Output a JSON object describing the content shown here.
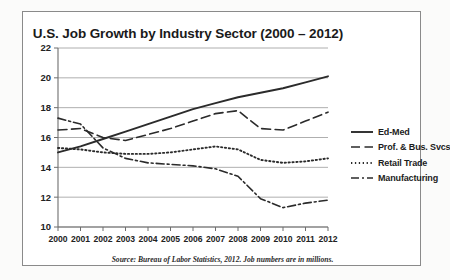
{
  "chart_data": {
    "type": "line",
    "title": "U.S. Job Growth by Industry Sector (2000 – 2012)",
    "xlabel": "",
    "ylabel": "",
    "source_note": "Source: Bureau of Labor Statistics, 2012.  Job numbers are in millions.",
    "categories": [
      "2000",
      "2001",
      "2002",
      "2003",
      "2004",
      "2005",
      "2006",
      "2007",
      "2008",
      "2009",
      "2010",
      "2011",
      "2012"
    ],
    "x": [
      2000,
      2001,
      2002,
      2003,
      2004,
      2005,
      2006,
      2007,
      2008,
      2009,
      2010,
      2011,
      2012
    ],
    "ylim": [
      10,
      22
    ],
    "xlim": [
      2000,
      2012
    ],
    "yticks": [
      10,
      12,
      14,
      16,
      18,
      20,
      22
    ],
    "grid": true,
    "legend_position": "right",
    "units": "millions of jobs",
    "series": [
      {
        "name": "Ed-Med",
        "style": "solid",
        "color": "#2b2b2b",
        "values": [
          15.0,
          15.4,
          15.9,
          16.4,
          16.9,
          17.4,
          17.9,
          18.3,
          18.7,
          19.0,
          19.3,
          19.7,
          20.1
        ]
      },
      {
        "name": "Prof. & Bus. Svcs",
        "style": "dashed",
        "color": "#2b2b2b",
        "values": [
          16.5,
          16.6,
          16.0,
          15.8,
          16.2,
          16.6,
          17.1,
          17.6,
          17.8,
          16.6,
          16.5,
          17.1,
          17.7
        ]
      },
      {
        "name": "Retail Trade",
        "style": "dotted",
        "color": "#2b2b2b",
        "values": [
          15.3,
          15.2,
          15.0,
          14.9,
          14.9,
          15.0,
          15.2,
          15.4,
          15.2,
          14.5,
          14.3,
          14.4,
          14.6
        ]
      },
      {
        "name": "Manufacturing",
        "style": "dash-dot",
        "color": "#2b2b2b",
        "values": [
          17.3,
          16.9,
          15.3,
          14.6,
          14.3,
          14.2,
          14.1,
          13.9,
          13.4,
          11.9,
          11.3,
          11.6,
          11.8
        ]
      }
    ]
  }
}
